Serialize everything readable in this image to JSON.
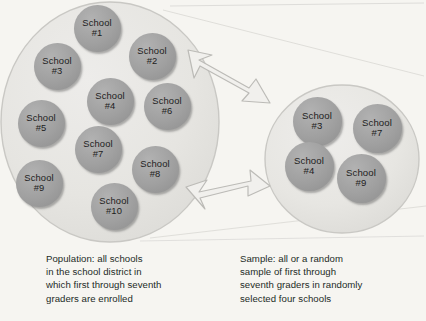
{
  "figure": {
    "background_color": "#f6f5f1",
    "group_fill": "#e6e5e1",
    "group_stroke": "#c9c8c4",
    "school_fill": "#a0a0a0",
    "school_text_color": "#1d1d1d",
    "arrow_fill": "#efeeeb",
    "arrow_stroke": "#b9b8b4",
    "connector_color": "#d8d7d3",
    "caption_color": "#1c2b26"
  },
  "population": {
    "label": "population-group",
    "schools": [
      {
        "name_line1": "School",
        "name_line2": "#1",
        "cx": 97,
        "cy": 28
      },
      {
        "name_line1": "School",
        "name_line2": "#2",
        "cx": 152,
        "cy": 56
      },
      {
        "name_line1": "School",
        "name_line2": "#3",
        "cx": 57,
        "cy": 66
      },
      {
        "name_line1": "School",
        "name_line2": "#4",
        "cx": 110,
        "cy": 101
      },
      {
        "name_line1": "School",
        "name_line2": "#5",
        "cx": 41,
        "cy": 123
      },
      {
        "name_line1": "School",
        "name_line2": "#6",
        "cx": 167,
        "cy": 106
      },
      {
        "name_line1": "School",
        "name_line2": "#7",
        "cx": 98,
        "cy": 149
      },
      {
        "name_line1": "School",
        "name_line2": "#8",
        "cx": 155,
        "cy": 169
      },
      {
        "name_line1": "School",
        "name_line2": "#9",
        "cx": 39,
        "cy": 183
      },
      {
        "name_line1": "School",
        "name_line2": "#10",
        "cx": 114,
        "cy": 206
      }
    ]
  },
  "sample": {
    "label": "sample-group",
    "schools": [
      {
        "name_line1": "School",
        "name_line2": "#3",
        "cx": 317,
        "cy": 121
      },
      {
        "name_line1": "School",
        "name_line2": "#7",
        "cx": 377,
        "cy": 128
      },
      {
        "name_line1": "School",
        "name_line2": "#4",
        "cx": 309,
        "cy": 166
      },
      {
        "name_line1": "School",
        "name_line2": "#9",
        "cx": 361,
        "cy": 178
      }
    ]
  },
  "captions": {
    "population": "Population: all schools\nin the school district in\nwhich first through seventh\ngraders are enrolled",
    "sample": "Sample: all or a random\nsample of first through\nseventh graders in randomly\nselected four schools"
  },
  "arrows": [
    {
      "name": "arrow-top",
      "direction": "right"
    },
    {
      "name": "arrow-bottom",
      "direction": "right"
    }
  ]
}
